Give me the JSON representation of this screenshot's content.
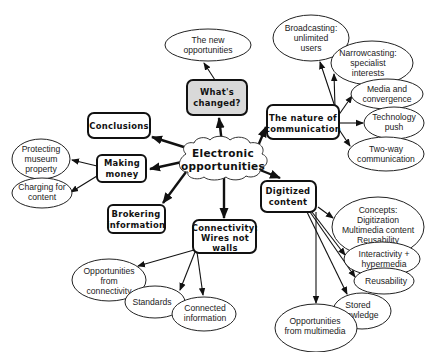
{
  "diagram": {
    "type": "concept-map",
    "center": {
      "id": "center",
      "lines": [
        "Electronic",
        "opportunities"
      ]
    },
    "topics": [
      {
        "id": "whats_changed",
        "lines": [
          "What's",
          "changed?"
        ],
        "highlight_color": "#d9d9d9"
      },
      {
        "id": "conclusions",
        "lines": [
          "Conclusions"
        ]
      },
      {
        "id": "making_money",
        "lines": [
          "Making",
          "money"
        ]
      },
      {
        "id": "brokering",
        "lines": [
          "Brokering",
          "information"
        ]
      },
      {
        "id": "nature_comm",
        "lines": [
          "The nature of",
          "communication"
        ]
      },
      {
        "id": "digitized",
        "lines": [
          "Digitized",
          "content"
        ]
      },
      {
        "id": "connectivity",
        "lines": [
          "Connectivity:",
          "Wires not",
          "walls"
        ]
      }
    ],
    "subtopics": [
      {
        "id": "new_opps",
        "parent": "whats_changed",
        "lines": [
          "The new",
          "opportunities"
        ]
      },
      {
        "id": "protecting",
        "parent": "making_money",
        "lines": [
          "Protecting",
          "museum",
          "property"
        ]
      },
      {
        "id": "charging",
        "parent": "making_money",
        "lines": [
          "Charging for",
          "content"
        ]
      },
      {
        "id": "broadcasting",
        "parent": "nature_comm",
        "lines": [
          "Broadcasting:",
          "unlimited",
          "users"
        ]
      },
      {
        "id": "narrowcasting",
        "parent": "nature_comm",
        "lines": [
          "Narrowcasting:",
          "specialist",
          "interests"
        ]
      },
      {
        "id": "media_conv",
        "parent": "nature_comm",
        "lines": [
          "Media and",
          "convergence"
        ]
      },
      {
        "id": "tech_push",
        "parent": "nature_comm",
        "lines": [
          "Technology",
          "push"
        ]
      },
      {
        "id": "two_way",
        "parent": "nature_comm",
        "lines": [
          "Two-way",
          "communication"
        ]
      },
      {
        "id": "concepts",
        "parent": "digitized",
        "lines": [
          "Concepts:",
          "Digitization",
          "Multimedia content",
          "Reusability"
        ]
      },
      {
        "id": "interactivity",
        "parent": "digitized",
        "lines": [
          "Interactivity +",
          "hypermedia"
        ]
      },
      {
        "id": "reusability",
        "parent": "digitized",
        "lines": [
          "Reusability"
        ]
      },
      {
        "id": "stored",
        "parent": "digitized",
        "lines": [
          "Stored",
          "knowledge"
        ]
      },
      {
        "id": "opps_multimedia",
        "parent": "digitized",
        "lines": [
          "Opportunities",
          "from multimedia"
        ]
      },
      {
        "id": "opps_connectivity",
        "parent": "connectivity",
        "lines": [
          "Opportunities",
          "from",
          "connectivity"
        ]
      },
      {
        "id": "standards",
        "parent": "connectivity",
        "lines": [
          "Standards"
        ]
      },
      {
        "id": "connected_info",
        "parent": "connectivity",
        "lines": [
          "Connected",
          "information"
        ]
      }
    ]
  }
}
